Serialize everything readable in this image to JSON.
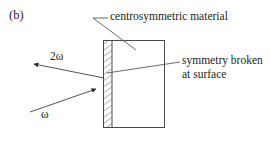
{
  "figure": {
    "panel_label": "(b)",
    "caption_absent": true,
    "stroke_color": "#4a4a4a",
    "text_color": "#1d1d1d",
    "background_color": "#ffffff",
    "labels": {
      "centrosymmetric": "centrosymmetric material",
      "symmetry_broken_line1": "symmetry broken",
      "symmetry_broken_line2": "at surface",
      "incident_beam": "ω",
      "second_harmonic_beam": "2ω"
    },
    "geometry": {
      "slab": {
        "x": 103,
        "y": 40,
        "width": 62,
        "height": 88
      },
      "surface_layer": {
        "x": 103,
        "y": 40,
        "width": 9,
        "height": 88,
        "fill": "hatched"
      },
      "incident_arrow": {
        "from": [
          30,
          112
        ],
        "to": [
          97,
          89
        ]
      },
      "second_harmonic_arrow": {
        "from": [
          104,
          78
        ],
        "to": [
          33,
          64
        ]
      },
      "leader_centrosymmetric": [
        [
          108,
          18
        ],
        [
          93,
          18
        ],
        [
          136,
          50
        ]
      ],
      "leader_symmetry_broken": [
        [
          180,
          62
        ],
        [
          107,
          73
        ]
      ]
    },
    "icons": {
      "arrowhead": "arrow-head-icon",
      "hatch": "diagonal-hatch-pattern-icon"
    }
  }
}
